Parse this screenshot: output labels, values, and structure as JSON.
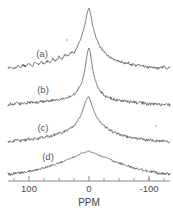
{
  "figure": {
    "name": "nmr-spectra-stack",
    "background_color": "#ffffff",
    "trace_color": "#555558",
    "axis_color": "#6a6a6e",
    "text_color": "#4a4a4e"
  },
  "axis": {
    "title": "PPM",
    "tick_labels": [
      "100",
      "0",
      "-100"
    ],
    "tick_values": [
      100,
      0,
      -100
    ],
    "minor_tick_values": [
      125,
      75,
      50,
      25,
      -25,
      -50,
      -75,
      -100,
      -125
    ],
    "range": [
      135,
      -135
    ],
    "reversed": true
  },
  "traces": [
    {
      "label": "(a)",
      "label_x": 42,
      "label_y": 57
    },
    {
      "label": "(b)",
      "label_x": 43,
      "label_y": 93
    },
    {
      "label": "(c)",
      "label_x": 43,
      "label_y": 131
    },
    {
      "label": "(d)",
      "label_x": 48,
      "label_y": 160
    }
  ],
  "chart_data": {
    "type": "line",
    "title": "",
    "xlabel": "PPM",
    "ylabel": "",
    "xlim": [
      135,
      -135
    ],
    "grid": false,
    "legend": "none",
    "x": [
      135,
      130,
      125,
      120,
      115,
      110,
      105,
      100,
      95,
      90,
      85,
      80,
      75,
      70,
      65,
      60,
      55,
      50,
      45,
      40,
      35,
      30,
      25,
      20,
      15,
      12,
      9,
      6,
      4,
      2,
      0,
      -2,
      -4,
      -6,
      -9,
      -12,
      -15,
      -20,
      -25,
      -30,
      -35,
      -40,
      -45,
      -50,
      -55,
      -60,
      -65,
      -70,
      -75,
      -80,
      -85,
      -90,
      -95,
      -100,
      -105,
      -110,
      -115,
      -120,
      -125,
      -130,
      -135
    ],
    "series": [
      {
        "name": "(a)",
        "baseline_y": 70,
        "peak_ppm": 0,
        "peak_height": 62,
        "values": [
          2,
          3,
          1,
          4,
          2,
          5,
          3,
          6,
          4,
          7,
          5,
          8,
          6,
          9,
          8,
          11,
          9,
          13,
          11,
          15,
          14,
          18,
          17,
          23,
          29,
          34,
          40,
          48,
          54,
          59,
          62,
          58,
          52,
          45,
          38,
          32,
          27,
          22,
          18,
          15,
          13,
          11,
          10,
          9,
          8,
          7,
          7,
          6,
          5,
          5,
          4,
          4,
          3,
          3,
          3,
          2,
          2,
          2,
          3,
          2,
          2
        ]
      },
      {
        "name": "(b)",
        "baseline_y": 106,
        "peak_ppm": 0,
        "peak_height": 58,
        "values": [
          1,
          2,
          1,
          3,
          2,
          3,
          2,
          4,
          3,
          4,
          3,
          5,
          4,
          5,
          5,
          6,
          6,
          7,
          7,
          8,
          9,
          10,
          12,
          15,
          20,
          24,
          30,
          40,
          48,
          55,
          58,
          54,
          46,
          37,
          29,
          23,
          18,
          14,
          11,
          9,
          8,
          7,
          6,
          6,
          5,
          5,
          4,
          4,
          4,
          3,
          3,
          3,
          2,
          2,
          2,
          2,
          2,
          1,
          2,
          1,
          1
        ]
      },
      {
        "name": "(c)",
        "baseline_y": 143,
        "peak_ppm": 0,
        "peak_height": 46,
        "values": [
          2,
          1,
          2,
          3,
          2,
          3,
          3,
          4,
          3,
          5,
          4,
          6,
          5,
          7,
          6,
          8,
          8,
          10,
          10,
          12,
          13,
          15,
          17,
          21,
          26,
          30,
          35,
          41,
          44,
          46,
          46,
          43,
          39,
          35,
          31,
          27,
          24,
          20,
          17,
          15,
          13,
          11,
          10,
          9,
          8,
          7,
          6,
          6,
          5,
          5,
          4,
          4,
          3,
          3,
          3,
          2,
          2,
          2,
          2,
          2,
          1
        ]
      },
      {
        "name": "(d)",
        "baseline_y": 175,
        "peak_ppm": 0,
        "peak_height": 24,
        "values": [
          1,
          1,
          2,
          2,
          2,
          3,
          3,
          4,
          4,
          5,
          5,
          6,
          7,
          8,
          9,
          10,
          11,
          12,
          13,
          14,
          16,
          17,
          18,
          19,
          21,
          22,
          22,
          23,
          23,
          24,
          24,
          23,
          23,
          22,
          22,
          21,
          20,
          19,
          18,
          17,
          16,
          14,
          13,
          12,
          11,
          10,
          9,
          8,
          7,
          6,
          6,
          5,
          4,
          4,
          3,
          3,
          2,
          2,
          2,
          1,
          1
        ]
      }
    ]
  }
}
